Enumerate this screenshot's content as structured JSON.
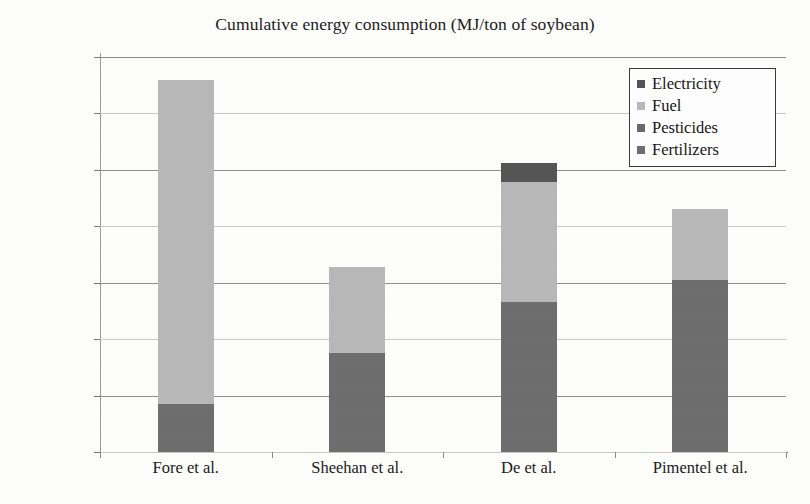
{
  "chart_data": {
    "type": "bar",
    "stacked": true,
    "title": "Cumulative energy consumption (MJ/ton of soybean)",
    "xlabel": "",
    "ylabel": "",
    "categories": [
      "Fore et al.",
      "Sheehan et al.",
      "De et al.",
      "Pimentel et al."
    ],
    "series": [
      {
        "name": "Fertilizers",
        "color": "#6e6e6e",
        "values": [
          845,
          1760,
          2660,
          3050
        ]
      },
      {
        "name": "Pesticides",
        "color": "#6a6a6a",
        "values": [
          0,
          0,
          0,
          0
        ]
      },
      {
        "name": "Fuel",
        "color": "#b8b8b8",
        "values": [
          5755,
          1520,
          2120,
          1250
        ]
      },
      {
        "name": "Electricity",
        "color": "#555555",
        "values": [
          0,
          0,
          350,
          0
        ]
      }
    ],
    "totals": [
      6600,
      3280,
      5130,
      4300
    ],
    "ylim": [
      0,
      7000
    ],
    "ytick_step": 1000,
    "yticks": [
      0,
      1000,
      2000,
      3000,
      4000,
      5000,
      6000,
      7000
    ],
    "ytick_labels": [
      "0",
      "1000",
      "2000",
      "3000",
      "4000",
      "5000",
      "6000",
      "7000"
    ],
    "grid": true,
    "legend_position": "top-right",
    "legend_entries": [
      {
        "label": "Electricity",
        "color": "#555555"
      },
      {
        "label": "Fuel",
        "color": "#b8b8b8"
      },
      {
        "label": "Pesticides",
        "color": "#6a6a6a"
      },
      {
        "label": "Fertilizers",
        "color": "#6e6e6e"
      }
    ]
  }
}
